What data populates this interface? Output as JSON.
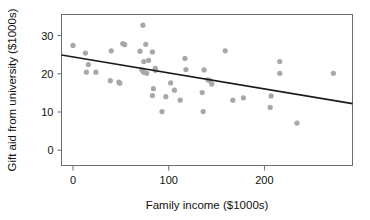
{
  "chart_data": {
    "type": "scatter",
    "title": "",
    "xlabel": "Family income ($1000s)",
    "ylabel": "Gift aid from university ($1000s)",
    "xlim": [
      -12,
      292
    ],
    "ylim": [
      -4,
      35.5
    ],
    "xticks": [
      0,
      100,
      200
    ],
    "xticklabels": [
      "0",
      "100",
      "200"
    ],
    "yticks": [
      0,
      10,
      20,
      30
    ],
    "yticklabels": [
      "0",
      "10",
      "20",
      "30"
    ],
    "grid": false,
    "legend": null,
    "marker_color": "#a8a8a8",
    "line_color": "#1a1a1a",
    "frame_color": "#6d6d6d",
    "points": [
      {
        "x": 0,
        "y": 27.4
      },
      {
        "x": 13,
        "y": 25.4
      },
      {
        "x": 16,
        "y": 22.4
      },
      {
        "x": 14,
        "y": 20.4
      },
      {
        "x": 24,
        "y": 20.4
      },
      {
        "x": 40,
        "y": 26.0
      },
      {
        "x": 39,
        "y": 18.2
      },
      {
        "x": 48,
        "y": 17.8
      },
      {
        "x": 49,
        "y": 17.5
      },
      {
        "x": 52,
        "y": 27.9
      },
      {
        "x": 54,
        "y": 27.6
      },
      {
        "x": 70,
        "y": 25.9
      },
      {
        "x": 73,
        "y": 32.7
      },
      {
        "x": 76,
        "y": 27.7
      },
      {
        "x": 74,
        "y": 23.2
      },
      {
        "x": 79,
        "y": 23.5
      },
      {
        "x": 72,
        "y": 21.0
      },
      {
        "x": 74,
        "y": 20.4
      },
      {
        "x": 77,
        "y": 20.1
      },
      {
        "x": 83,
        "y": 25.7
      },
      {
        "x": 86,
        "y": 21.4
      },
      {
        "x": 86,
        "y": 20.9
      },
      {
        "x": 84,
        "y": 16.1
      },
      {
        "x": 83,
        "y": 14.3
      },
      {
        "x": 93,
        "y": 10.1
      },
      {
        "x": 97,
        "y": 14.0
      },
      {
        "x": 102,
        "y": 17.6
      },
      {
        "x": 106,
        "y": 15.7
      },
      {
        "x": 112,
        "y": 13.1
      },
      {
        "x": 117,
        "y": 24.0
      },
      {
        "x": 118,
        "y": 21.1
      },
      {
        "x": 136,
        "y": 10.1
      },
      {
        "x": 135,
        "y": 15.1
      },
      {
        "x": 137,
        "y": 21.0
      },
      {
        "x": 141,
        "y": 18.4
      },
      {
        "x": 143,
        "y": 18.2
      },
      {
        "x": 145,
        "y": 17.3
      },
      {
        "x": 159,
        "y": 26.0
      },
      {
        "x": 167,
        "y": 13.1
      },
      {
        "x": 178,
        "y": 13.7
      },
      {
        "x": 206,
        "y": 11.2
      },
      {
        "x": 207,
        "y": 14.2
      },
      {
        "x": 216,
        "y": 23.2
      },
      {
        "x": 216,
        "y": 20.1
      },
      {
        "x": 234,
        "y": 7.1
      },
      {
        "x": 272,
        "y": 20.1
      }
    ],
    "trend_line": {
      "x_start": -12,
      "y_start": 24.9,
      "x_end": 292,
      "y_end": 12.2
    }
  }
}
